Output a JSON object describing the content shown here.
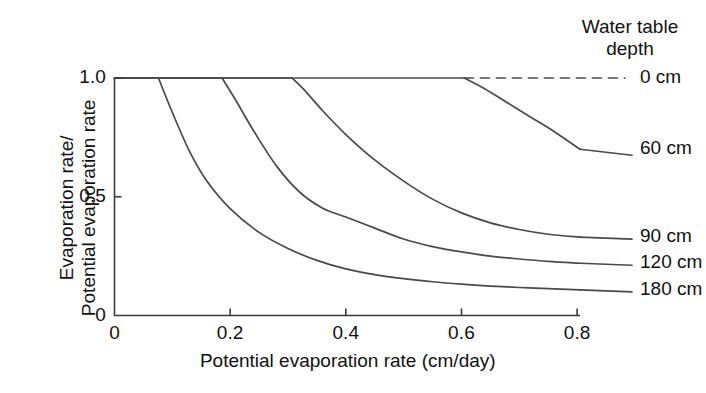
{
  "chart_data": {
    "type": "line",
    "title": "",
    "subtitle": "",
    "xlabel": "Potential evaporation rate (cm/day)",
    "ylabel": "Evaporation rate/ Potential evaporation rate",
    "ylabel_line1": "Evaporation rate/",
    "ylabel_line2": "Potential evaporation rate",
    "xlim": [
      0,
      0.805
    ],
    "ylim": [
      0,
      1.05
    ],
    "xticks": [
      0,
      0.2,
      0.4,
      0.6,
      0.8
    ],
    "xticklabels": [
      "0",
      "0.2",
      "0.4",
      "0.6",
      "0.8"
    ],
    "yticks": [
      0,
      0.5,
      1.0
    ],
    "yticklabels": [
      "0",
      "0.5",
      "1.0"
    ],
    "grid": false,
    "legend_position": "right-outside",
    "legend_title_line1": "Water table",
    "legend_title_line2": "depth",
    "legend_title": "Water table depth",
    "series": [
      {
        "name": "0 cm",
        "label": "0 cm",
        "style": "dashed",
        "breakpoint_x": 0.0,
        "points": [
          [
            0.0,
            1.0
          ],
          [
            0.805,
            1.0
          ]
        ]
      },
      {
        "name": "60 cm",
        "label": "60 cm",
        "style": "solid",
        "breakpoint_x": 0.605,
        "points": [
          [
            0.0,
            1.0
          ],
          [
            0.605,
            1.0
          ],
          [
            0.64,
            0.955
          ],
          [
            0.68,
            0.895
          ],
          [
            0.72,
            0.835
          ],
          [
            0.76,
            0.775
          ],
          [
            0.805,
            0.7
          ]
        ]
      },
      {
        "name": "90 cm",
        "label": "90 cm",
        "style": "solid",
        "breakpoint_x": 0.307,
        "points": [
          [
            0.0,
            1.0
          ],
          [
            0.307,
            1.0
          ],
          [
            0.33,
            0.945
          ],
          [
            0.36,
            0.862
          ],
          [
            0.4,
            0.762
          ],
          [
            0.45,
            0.655
          ],
          [
            0.5,
            0.566
          ],
          [
            0.55,
            0.49
          ],
          [
            0.6,
            0.432
          ],
          [
            0.65,
            0.39
          ],
          [
            0.7,
            0.362
          ],
          [
            0.75,
            0.342
          ],
          [
            0.805,
            0.33
          ]
        ]
      },
      {
        "name": "120 cm",
        "label": "120 cm",
        "style": "solid",
        "breakpoint_x": 0.186,
        "points": [
          [
            0.0,
            1.0
          ],
          [
            0.186,
            1.0
          ],
          [
            0.21,
            0.905
          ],
          [
            0.24,
            0.78
          ],
          [
            0.28,
            0.63
          ],
          [
            0.32,
            0.52
          ],
          [
            0.36,
            0.452
          ],
          [
            0.4,
            0.415
          ],
          [
            0.45,
            0.368
          ],
          [
            0.5,
            0.322
          ],
          [
            0.55,
            0.29
          ],
          [
            0.6,
            0.268
          ],
          [
            0.65,
            0.25
          ],
          [
            0.7,
            0.238
          ],
          [
            0.75,
            0.228
          ],
          [
            0.805,
            0.22
          ]
        ]
      },
      {
        "name": "180 cm",
        "label": "180 cm",
        "style": "solid",
        "breakpoint_x": 0.076,
        "points": [
          [
            0.0,
            1.0
          ],
          [
            0.076,
            1.0
          ],
          [
            0.1,
            0.855
          ],
          [
            0.13,
            0.69
          ],
          [
            0.16,
            0.565
          ],
          [
            0.2,
            0.45
          ],
          [
            0.25,
            0.35
          ],
          [
            0.3,
            0.282
          ],
          [
            0.35,
            0.232
          ],
          [
            0.4,
            0.196
          ],
          [
            0.45,
            0.172
          ],
          [
            0.5,
            0.155
          ],
          [
            0.55,
            0.142
          ],
          [
            0.6,
            0.132
          ],
          [
            0.65,
            0.124
          ],
          [
            0.7,
            0.118
          ],
          [
            0.75,
            0.113
          ],
          [
            0.805,
            0.108
          ]
        ]
      }
    ]
  },
  "colors": {
    "background": "#ffffff",
    "axis": "#3a3a3a",
    "line": "#4a4a4a",
    "text": "#111111"
  }
}
